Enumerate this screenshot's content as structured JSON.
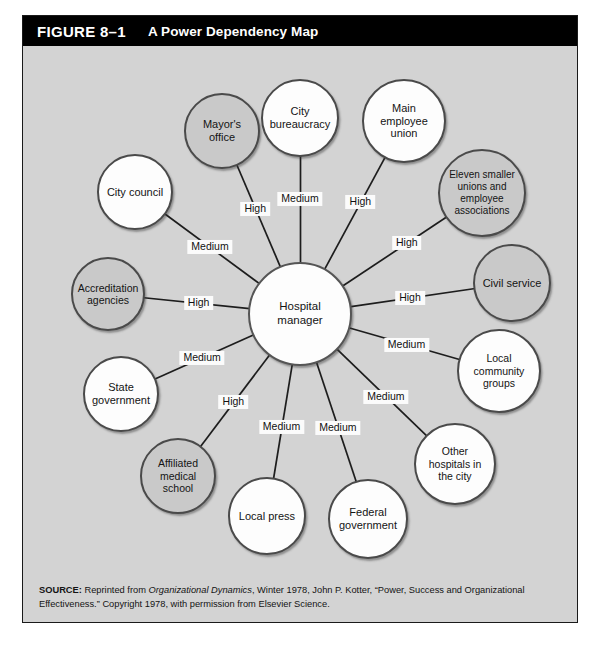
{
  "figure": {
    "number": "FIGURE 8–1",
    "title": "A Power Dependency Map"
  },
  "diagram": {
    "center": {
      "id": "hospital-manager",
      "label": "Hospital manager",
      "fill": "white"
    },
    "nodes": [
      {
        "id": "city-bureaucracy",
        "label": "City bureaucracy",
        "fill": "white"
      },
      {
        "id": "mayors-office",
        "label": "Mayor's office",
        "fill": "gray"
      },
      {
        "id": "city-council",
        "label": "City council",
        "fill": "white"
      },
      {
        "id": "accreditation-agencies",
        "label": "Accreditation agencies",
        "fill": "gray"
      },
      {
        "id": "state-government",
        "label": "State government",
        "fill": "white"
      },
      {
        "id": "affiliated-medical-school",
        "label": "Affiliated medical school",
        "fill": "gray"
      },
      {
        "id": "local-press",
        "label": "Local press",
        "fill": "white"
      },
      {
        "id": "federal-government",
        "label": "Federal government",
        "fill": "white"
      },
      {
        "id": "other-hospitals",
        "label": "Other hospitals in the city",
        "fill": "white"
      },
      {
        "id": "local-community-groups",
        "label": "Local community groups",
        "fill": "white"
      },
      {
        "id": "civil-service",
        "label": "Civil service",
        "fill": "gray"
      },
      {
        "id": "eleven-smaller-unions",
        "label": "Eleven smaller unions and employee associations",
        "fill": "gray"
      },
      {
        "id": "main-employee-union",
        "label": "Main employee union",
        "fill": "white"
      }
    ],
    "edges": [
      {
        "from": "hospital-manager",
        "to": "city-bureaucracy",
        "label": "Medium"
      },
      {
        "from": "hospital-manager",
        "to": "mayors-office",
        "label": "High"
      },
      {
        "from": "hospital-manager",
        "to": "city-council",
        "label": "Medium"
      },
      {
        "from": "hospital-manager",
        "to": "accreditation-agencies",
        "label": "High"
      },
      {
        "from": "hospital-manager",
        "to": "state-government",
        "label": "Medium"
      },
      {
        "from": "hospital-manager",
        "to": "affiliated-medical-school",
        "label": "High"
      },
      {
        "from": "hospital-manager",
        "to": "local-press",
        "label": "Medium"
      },
      {
        "from": "hospital-manager",
        "to": "federal-government",
        "label": "Medium"
      },
      {
        "from": "hospital-manager",
        "to": "other-hospitals",
        "label": "Medium"
      },
      {
        "from": "hospital-manager",
        "to": "local-community-groups",
        "label": "Medium"
      },
      {
        "from": "hospital-manager",
        "to": "civil-service",
        "label": "High"
      },
      {
        "from": "hospital-manager",
        "to": "eleven-smaller-unions",
        "label": "High"
      },
      {
        "from": "hospital-manager",
        "to": "main-employee-union",
        "label": "High"
      }
    ],
    "legend_values": [
      "High",
      "Medium"
    ]
  },
  "source": {
    "label": "SOURCE:",
    "text_1": " Reprinted from ",
    "italic_1": "Organizational Dynamics",
    "text_2": ", Winter 1978, John P. Kotter, “Power, Success and Organizational Effectiveness.” Copyright 1978, with permission from Elsevier Science."
  },
  "colors": {
    "header_bg": "#000000",
    "header_text": "#ffffff",
    "canvas_bg": "#d3d3d3",
    "node_white": "#fdfdfd",
    "node_gray": "#c9c9c9",
    "node_border": "#4a4a4a",
    "edge_line": "#1d1d1d",
    "label_bg": "#fbfbfb"
  }
}
